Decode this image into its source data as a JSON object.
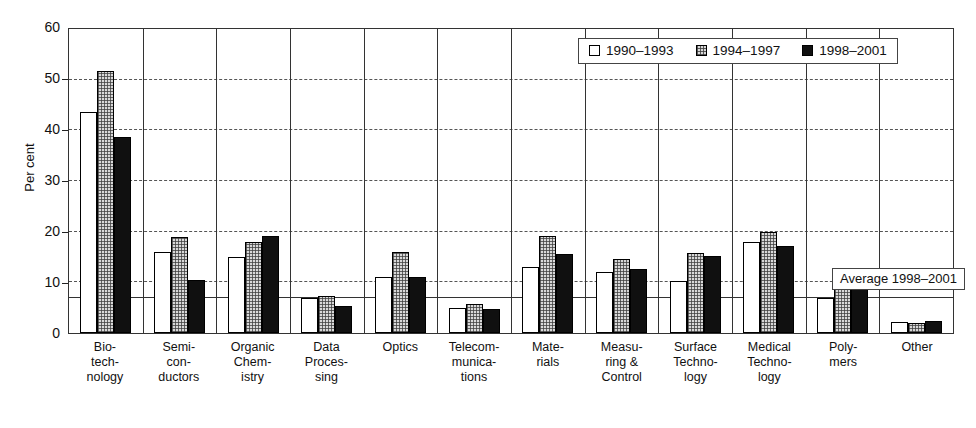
{
  "chart_data": {
    "type": "bar",
    "title": "",
    "xlabel": "",
    "ylabel": "Per cent",
    "ylim": [
      0,
      60
    ],
    "ytick_step": 10,
    "yticks": [
      0,
      10,
      20,
      30,
      40,
      50,
      60
    ],
    "grid": "horizontal-dashed",
    "legend_position": "top-right",
    "categories": [
      "Bio-\ntech-\nnology",
      "Semi-\ncon-\nductors",
      "Organic\nChem-\nistry",
      "Data\nProces-\nsing",
      "Optics",
      "Telecom-\nmunica-\ntions",
      "Mate-\nrials",
      "Measu-\nring &\nControl",
      "Surface\nTechno-\nlogy",
      "Medical\nTechno-\nlogy",
      "Poly-\nmers",
      "Other"
    ],
    "series": [
      {
        "name": "1990–1993",
        "fill": "white",
        "values": [
          43.7,
          16.0,
          15.0,
          7.0,
          11.0,
          5.0,
          13.0,
          12.0,
          10.3,
          17.9,
          6.9,
          2.1
        ]
      },
      {
        "name": "1994–1997",
        "fill": "gray-hatch",
        "values": [
          51.8,
          19.0,
          18.0,
          7.4,
          16.0,
          5.8,
          19.2,
          14.6,
          15.7,
          19.9,
          9.6,
          1.9
        ]
      },
      {
        "name": "1998–2001",
        "fill": "black",
        "values": [
          38.6,
          10.5,
          19.2,
          5.3,
          11.1,
          4.8,
          15.6,
          12.6,
          15.2,
          17.2,
          9.8,
          2.4
        ]
      }
    ],
    "annotations": [
      {
        "name": "average-line",
        "label": "Average 1998–2001",
        "value": 7.0,
        "style": "solid-horizontal-line"
      }
    ]
  },
  "axis": {
    "y_title": "Per cent"
  },
  "legend": {
    "items": [
      {
        "label": "1990–1993",
        "swatch": "legend-swatch-white"
      },
      {
        "label": "1994–1997",
        "swatch": "legend-swatch-gray"
      },
      {
        "label": "1998–2001",
        "swatch": "legend-swatch-black"
      }
    ]
  },
  "annotation": {
    "average_label": "Average 1998–2001"
  },
  "colors": {
    "series_1990_1993": "#ffffff",
    "series_1994_1997": "#d8d8d8",
    "series_1998_2001": "#101010",
    "axis": "#333333",
    "gridline": "#555555",
    "text": "#111111"
  }
}
